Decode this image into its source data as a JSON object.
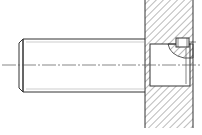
{
  "drawing": {
    "title": "Shaft inserted into hatched plate with set screw (technical section view)",
    "colors": {
      "background": "#ffffff",
      "line": "#333333",
      "hatch": "#555555",
      "centerline": "#555555"
    },
    "parts": [
      {
        "name": "shaft",
        "label": "Shaft"
      },
      {
        "name": "plate-section",
        "label": "Plate (sectioned)"
      },
      {
        "name": "bore",
        "label": "Bore"
      },
      {
        "name": "set-screw",
        "label": "Set screw"
      },
      {
        "name": "centerline",
        "label": "Axis centerline"
      }
    ]
  }
}
